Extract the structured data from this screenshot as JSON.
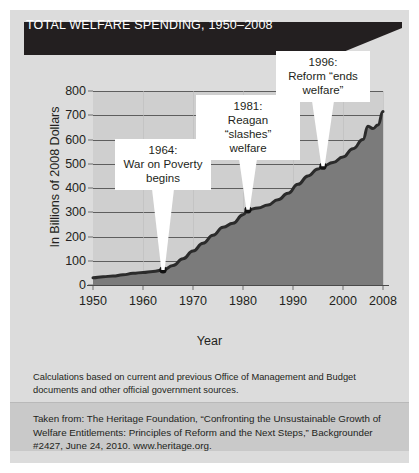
{
  "banner": {
    "title": "TOTAL WELFARE SPENDING, 1950–2008"
  },
  "footer": {
    "calculations_note": "Calculations based on current and previous Office of Management and Budget documents and other official government sources.",
    "source_note": "Taken from: The Heritage Foundation, “Confronting the Unsustainable Growth of Welfare Entitlements: Principles of Reform and the Next Steps,” Backgrounder #2427, June 24, 2010. www.heritage.org."
  },
  "colors": {
    "banner_background": "#231f20",
    "card_background": "#dcdcdc",
    "plot_background": "#cfcfcf",
    "area_fill": "#7b7b7b",
    "line": "#2b2b2b",
    "gridline": "#4a4a4a",
    "callout_background": "#ffffff",
    "source_band": "#c9c9c9"
  },
  "chart_data": {
    "type": "area",
    "title": "TOTAL WELFARE SPENDING, 1950–2008",
    "xlabel": "Year",
    "ylabel": "In Billions of 2008 Dollars",
    "xlim": [
      1950,
      2008
    ],
    "ylim": [
      0,
      800
    ],
    "yticks": [
      0,
      100,
      200,
      300,
      400,
      500,
      600,
      700,
      800
    ],
    "xticks": [
      1950,
      1960,
      1970,
      1980,
      1990,
      2000,
      2008
    ],
    "grid": true,
    "legend": "none",
    "series": [
      {
        "name": "Total welfare spending",
        "x": [
          1950,
          1952,
          1954,
          1956,
          1958,
          1960,
          1962,
          1964,
          1966,
          1968,
          1970,
          1972,
          1974,
          1976,
          1978,
          1980,
          1981,
          1983,
          1985,
          1987,
          1989,
          1991,
          1993,
          1995,
          1996,
          1998,
          2000,
          2002,
          2004,
          2005,
          2006,
          2007,
          2008
        ],
        "values": [
          30,
          34,
          37,
          42,
          48,
          52,
          56,
          62,
          80,
          108,
          140,
          172,
          205,
          238,
          255,
          290,
          310,
          318,
          330,
          352,
          378,
          415,
          450,
          478,
          490,
          505,
          528,
          562,
          600,
          655,
          645,
          660,
          715
        ]
      }
    ],
    "markers": [
      {
        "year": 1964,
        "value": 62,
        "label": "1964: War on Poverty begins"
      },
      {
        "year": 1981,
        "value": 310,
        "label": "1981: Reagan “slashes” welfare"
      },
      {
        "year": 1996,
        "value": 490,
        "label": "1996: Reform “ends welfare”"
      }
    ],
    "annotations": [
      {
        "id": "war-on-poverty",
        "year": 1964,
        "lines": [
          "1964:",
          "War on Poverty",
          "begins"
        ]
      },
      {
        "id": "reagan-slashes",
        "year": 1981,
        "lines": [
          "1981:",
          "Reagan “slashes”",
          "welfare"
        ]
      },
      {
        "id": "reform-ends-welfare",
        "year": 1996,
        "lines": [
          "1996:",
          "Reform “ends",
          "welfare”"
        ]
      }
    ]
  }
}
